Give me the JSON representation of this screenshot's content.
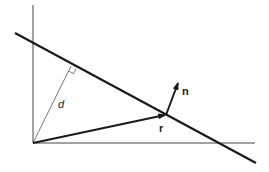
{
  "diagram": {
    "type": "vector-geometry",
    "colors": {
      "background": "#ffffff",
      "stroke": "#1a1a1a",
      "axis": "#444444",
      "thin": "#555555"
    },
    "labels": {
      "distance": "d",
      "normal": "n",
      "position": "r"
    },
    "elements": [
      {
        "id": "y-axis",
        "kind": "axis"
      },
      {
        "id": "x-axis",
        "kind": "axis"
      },
      {
        "id": "line",
        "kind": "thick-line"
      },
      {
        "id": "perpendicular-d",
        "kind": "thin-line",
        "label": "d"
      },
      {
        "id": "right-angle-marker",
        "kind": "marker"
      },
      {
        "id": "vector-r",
        "kind": "arrow",
        "label": "r"
      },
      {
        "id": "vector-n",
        "kind": "arrow",
        "label": "n"
      }
    ]
  }
}
